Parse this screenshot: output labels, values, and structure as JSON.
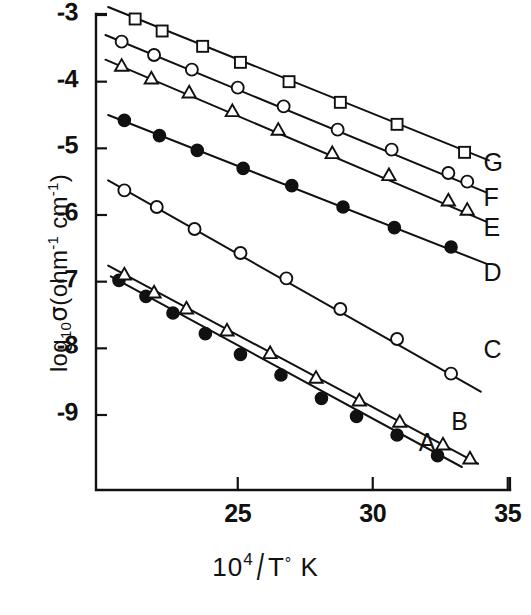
{
  "figure": {
    "background_color": "#ffffff",
    "ink_color": "#111111"
  },
  "axes": {
    "x_title_parts": {
      "base": "10",
      "exponent": "4",
      "slash": "/",
      "denominator": "T",
      "degree": "°",
      "unit": "K"
    },
    "x_title_text": "10^4 / T° K",
    "y_title_parts": {
      "log": "log",
      "log_sub": "10",
      "sigma": "σ",
      "open_paren": "(",
      "ohm": "ohm",
      "ohm_sup": "-1",
      "cm": "cm",
      "cm_sup": "-1",
      "close_paren": ")"
    },
    "y_title_text": "log10 σ(ohm^-1 cm^-1)",
    "x_ticks": [
      {
        "value": 25,
        "label": "25"
      },
      {
        "value": 30,
        "label": "30"
      },
      {
        "value": 35,
        "label": "35"
      }
    ],
    "y_ticks": [
      {
        "value": -3,
        "label": "-3"
      },
      {
        "value": -4,
        "label": "-4"
      },
      {
        "value": -5,
        "label": "-5"
      },
      {
        "value": -6,
        "label": "-6"
      },
      {
        "value": -7,
        "label": "-7"
      },
      {
        "value": -8,
        "label": "-8"
      },
      {
        "value": -9,
        "label": "-9"
      }
    ],
    "xlim": [
      19.75,
      35.0
    ],
    "ylim": [
      -9.85,
      -2.8
    ]
  },
  "chart_data": {
    "type": "scatter",
    "title": "",
    "subtitle": "",
    "xlabel": "10^4 / T° K",
    "ylabel": "log10 σ(ohm^-1 cm^-1)",
    "xlim": [
      19.75,
      35.0
    ],
    "ylim": [
      -9.85,
      -2.8
    ],
    "xticks": [
      25,
      30,
      35
    ],
    "yticks": [
      -3,
      -4,
      -5,
      -6,
      -7,
      -8,
      -9
    ],
    "grid": false,
    "legend": "inline-right-labels",
    "series": [
      {
        "name": "A",
        "label": "A",
        "marker": "filled-circle",
        "label_x": 32.0,
        "label_y": -9.45,
        "fit_line": {
          "x0": 20.3,
          "y0": -6.92,
          "x1": 33.3,
          "y1": -9.78
        },
        "points": [
          {
            "x": 20.6,
            "y": -6.98
          },
          {
            "x": 21.6,
            "y": -7.22
          },
          {
            "x": 22.6,
            "y": -7.47
          },
          {
            "x": 23.8,
            "y": -7.78
          },
          {
            "x": 25.1,
            "y": -8.09
          },
          {
            "x": 26.6,
            "y": -8.4
          },
          {
            "x": 28.1,
            "y": -8.75
          },
          {
            "x": 29.4,
            "y": -9.02
          },
          {
            "x": 30.9,
            "y": -9.3
          },
          {
            "x": 32.4,
            "y": -9.61
          }
        ]
      },
      {
        "name": "B",
        "label": "B",
        "marker": "open-triangle",
        "label_x": 33.2,
        "label_y": -9.13,
        "fit_line": {
          "x0": 20.2,
          "y0": -6.76,
          "x1": 33.9,
          "y1": -9.73
        },
        "points": [
          {
            "x": 20.8,
            "y": -6.9
          },
          {
            "x": 21.9,
            "y": -7.17
          },
          {
            "x": 23.1,
            "y": -7.41
          },
          {
            "x": 24.6,
            "y": -7.74
          },
          {
            "x": 26.2,
            "y": -8.08
          },
          {
            "x": 27.9,
            "y": -8.45
          },
          {
            "x": 29.5,
            "y": -8.79
          },
          {
            "x": 31.0,
            "y": -9.11
          },
          {
            "x": 32.6,
            "y": -9.45
          },
          {
            "x": 33.6,
            "y": -9.66
          }
        ]
      },
      {
        "name": "C",
        "label": "C",
        "marker": "open-circle",
        "label_x": 34.4,
        "label_y": -8.05,
        "fit_line": {
          "x0": 20.2,
          "y0": -5.48,
          "x1": 34.0,
          "y1": -8.65
        },
        "points": [
          {
            "x": 20.8,
            "y": -5.63
          },
          {
            "x": 22.0,
            "y": -5.88
          },
          {
            "x": 23.4,
            "y": -6.21
          },
          {
            "x": 25.1,
            "y": -6.57
          },
          {
            "x": 26.8,
            "y": -6.95
          },
          {
            "x": 28.8,
            "y": -7.41
          },
          {
            "x": 30.9,
            "y": -7.86
          },
          {
            "x": 32.9,
            "y": -8.38
          }
        ]
      },
      {
        "name": "D",
        "label": "D",
        "marker": "filled-circle",
        "label_x": 34.4,
        "label_y": -6.9,
        "fit_line": {
          "x0": 20.2,
          "y0": -4.5,
          "x1": 34.2,
          "y1": -6.73
        },
        "points": [
          {
            "x": 20.8,
            "y": -4.58
          },
          {
            "x": 22.1,
            "y": -4.81
          },
          {
            "x": 23.5,
            "y": -5.03
          },
          {
            "x": 25.2,
            "y": -5.3
          },
          {
            "x": 27.0,
            "y": -5.56
          },
          {
            "x": 28.9,
            "y": -5.88
          },
          {
            "x": 30.8,
            "y": -6.19
          },
          {
            "x": 32.9,
            "y": -6.48
          }
        ]
      },
      {
        "name": "E",
        "label": "E",
        "marker": "open-triangle",
        "label_x": 34.4,
        "label_y": -6.23,
        "fit_line": {
          "x0": 20.1,
          "y0": -3.67,
          "x1": 34.2,
          "y1": -6.1
        },
        "points": [
          {
            "x": 20.7,
            "y": -3.77
          },
          {
            "x": 21.8,
            "y": -3.96
          },
          {
            "x": 23.2,
            "y": -4.17
          },
          {
            "x": 24.8,
            "y": -4.45
          },
          {
            "x": 26.5,
            "y": -4.73
          },
          {
            "x": 28.5,
            "y": -5.08
          },
          {
            "x": 30.6,
            "y": -5.41
          },
          {
            "x": 32.8,
            "y": -5.79
          },
          {
            "x": 33.5,
            "y": -5.93
          }
        ]
      },
      {
        "name": "F",
        "label": "F",
        "marker": "open-circle",
        "label_x": 34.4,
        "label_y": -5.77,
        "fit_line": {
          "x0": 20.1,
          "y0": -3.3,
          "x1": 34.2,
          "y1": -5.66
        },
        "points": [
          {
            "x": 20.7,
            "y": -3.4
          },
          {
            "x": 21.9,
            "y": -3.6
          },
          {
            "x": 23.3,
            "y": -3.82
          },
          {
            "x": 25.0,
            "y": -4.09
          },
          {
            "x": 26.7,
            "y": -4.37
          },
          {
            "x": 28.7,
            "y": -4.72
          },
          {
            "x": 30.7,
            "y": -5.02
          },
          {
            "x": 32.8,
            "y": -5.37
          },
          {
            "x": 33.5,
            "y": -5.5
          }
        ]
      },
      {
        "name": "G",
        "label": "G",
        "marker": "open-square",
        "label_x": 34.4,
        "label_y": -5.25,
        "fit_line": {
          "x0": 20.2,
          "y0": -2.88,
          "x1": 34.3,
          "y1": -5.18
        },
        "points": [
          {
            "x": 21.2,
            "y": -3.06
          },
          {
            "x": 22.2,
            "y": -3.24
          },
          {
            "x": 23.7,
            "y": -3.47
          },
          {
            "x": 25.1,
            "y": -3.71
          },
          {
            "x": 26.9,
            "y": -4.0
          },
          {
            "x": 28.8,
            "y": -4.31
          },
          {
            "x": 30.9,
            "y": -4.64
          },
          {
            "x": 33.4,
            "y": -5.06
          }
        ]
      }
    ]
  }
}
